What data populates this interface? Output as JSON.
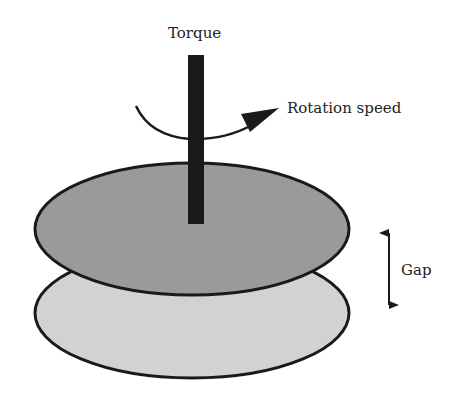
{
  "labels": {
    "torque": "Torque",
    "rotation_speed": "Rotation speed",
    "gap": "Gap"
  },
  "colors": {
    "background": "#ffffff",
    "upper_plate_fill": "#9a9a9a",
    "lower_plate_fill": "#d2d2d2",
    "outline": "#1a1a1a",
    "shaft": "#1a1a1a"
  }
}
